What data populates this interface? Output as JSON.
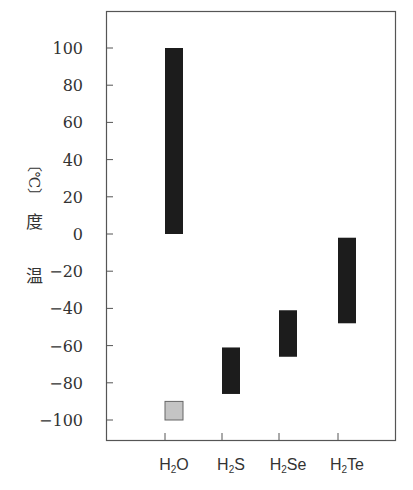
{
  "chart_data": {
    "type": "bar",
    "subtype": "floating-range",
    "title": "",
    "xlabel": "",
    "ylabel": "温度〔℃〕",
    "ylabel_chars": [
      "〔℃〕",
      "度",
      "温"
    ],
    "categories": [
      "H2O",
      "H2S",
      "H2Se",
      "H2Te"
    ],
    "category_labels": [
      {
        "main": "H",
        "sub": "2",
        "rest": "O"
      },
      {
        "main": "H",
        "sub": "2",
        "rest": "S"
      },
      {
        "main": "H",
        "sub": "2",
        "rest": "Se"
      },
      {
        "main": "H",
        "sub": "2",
        "rest": "Te"
      }
    ],
    "series": [
      {
        "name": "liquid range (melting point to boiling point)",
        "color": "#1c1c1c",
        "ranges": [
          [
            0,
            100
          ],
          [
            -86,
            -61
          ],
          [
            -66,
            -41
          ],
          [
            -48,
            -2
          ]
        ]
      },
      {
        "name": "H2O expected range",
        "color": "#c4c4c4",
        "ranges": [
          [
            -100,
            -90
          ],
          null,
          null,
          null
        ]
      }
    ],
    "yticks": [
      100,
      80,
      60,
      40,
      20,
      0,
      -20,
      -40,
      -60,
      -80,
      -100
    ],
    "ytick_labels": [
      "100",
      "80",
      "60",
      "40",
      "20",
      "0",
      "−20",
      "−40",
      "−60",
      "−80",
      "−100"
    ],
    "ylim": [
      -110,
      120
    ],
    "grid": false,
    "legend": null
  }
}
